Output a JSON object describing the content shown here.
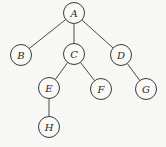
{
  "diagram": {
    "type": "tree",
    "root": "A",
    "nodes": [
      {
        "id": "A",
        "label": "A",
        "x": 74,
        "y": 13
      },
      {
        "id": "B",
        "label": "B",
        "x": 21,
        "y": 55
      },
      {
        "id": "C",
        "label": "C",
        "x": 74,
        "y": 54
      },
      {
        "id": "D",
        "label": "D",
        "x": 121,
        "y": 55
      },
      {
        "id": "E",
        "label": "E",
        "x": 49,
        "y": 88
      },
      {
        "id": "F",
        "label": "F",
        "x": 101,
        "y": 89
      },
      {
        "id": "G",
        "label": "G",
        "x": 146,
        "y": 89
      },
      {
        "id": "H",
        "label": "H",
        "x": 49,
        "y": 127
      }
    ],
    "edges": [
      {
        "from": "A",
        "to": "B"
      },
      {
        "from": "A",
        "to": "C"
      },
      {
        "from": "A",
        "to": "D"
      },
      {
        "from": "C",
        "to": "E"
      },
      {
        "from": "C",
        "to": "F"
      },
      {
        "from": "D",
        "to": "G"
      },
      {
        "from": "E",
        "to": "H"
      }
    ],
    "node_radius": 10.5
  }
}
